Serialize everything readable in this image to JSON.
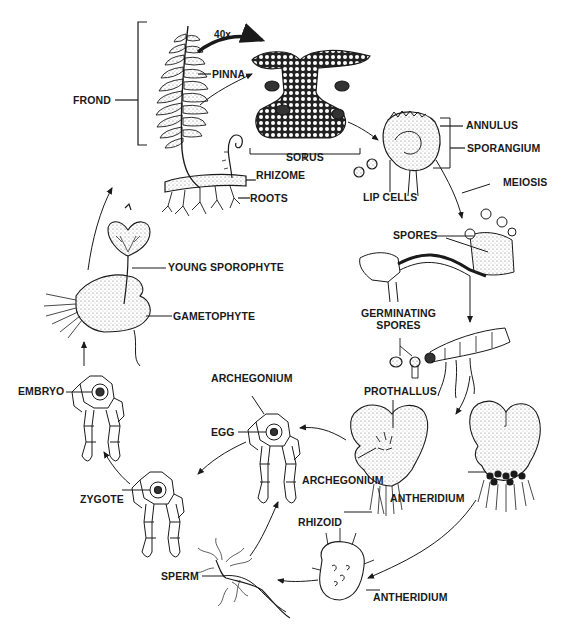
{
  "diagram": {
    "type": "fern-life-cycle",
    "colors": {
      "ink": "#1a1a1a",
      "background": "#ffffff",
      "stipple": "#6a6a6a"
    },
    "magnification": "40x",
    "labels": {
      "frond": "FROND",
      "pinna": "PINNA",
      "sorus": "SORUS",
      "rhizome": "RHIZOME",
      "roots": "ROOTS",
      "annulus": "ANNULUS",
      "sporangium": "SPORANGIUM",
      "lip_cells": "LIP CELLS",
      "meiosis": "MEIOSIS",
      "spores": "SPORES",
      "germinating_spores": "GERMINATING\nSPORES",
      "young_sporophyte": "YOUNG SPOROPHYTE",
      "gametophyte": "GAMETOPHYTE",
      "embryo": "EMBRYO",
      "archegonium_top": "ARCHEGONIUM",
      "egg": "EGG",
      "archegonium_mid": "ARCHEGONIUM",
      "prothallus": "PROTHALLUS",
      "antheridium_mid": "ANTHERIDIUM",
      "rhizoid": "RHIZOID",
      "zygote": "ZYGOTE",
      "sperm": "SPERM",
      "antheridium_bottom": "ANTHERIDIUM"
    },
    "cycle_order": [
      "Frond (sporophyte)",
      "Sorus",
      "Sporangium",
      "Spores (meiosis)",
      "Germinating spores",
      "Prothallus",
      "Antheridium / Archegonium",
      "Sperm",
      "Egg",
      "Zygote",
      "Embryo",
      "Gametophyte with young sporophyte"
    ]
  }
}
